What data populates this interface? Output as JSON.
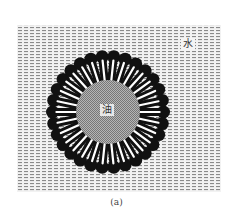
{
  "figure": {
    "caption": "(a)",
    "labels": {
      "water": "水",
      "oil": "油"
    },
    "micelle": {
      "cx": 108,
      "cy": 112,
      "outer_radius": 62,
      "head_radius": 6.5,
      "core_radius": 32,
      "molecule_count": 30
    },
    "water_region": {
      "x": 17,
      "y": 25,
      "width": 204,
      "height": 167
    },
    "colors": {
      "head": "#111111",
      "tail": "#ffffff",
      "core": "#9a9a9a",
      "hatch": "#8a8a8a",
      "background": "#ffffff"
    }
  }
}
